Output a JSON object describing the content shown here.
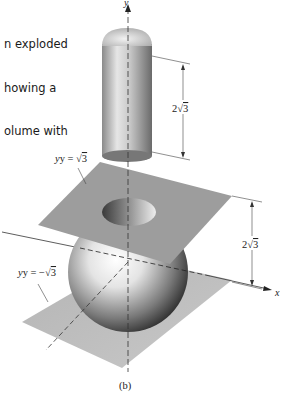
{
  "caption": {
    "lines": [
      "n exploded",
      "howing a",
      "olume with"
    ]
  },
  "figure": {
    "axes": {
      "y_label": "y",
      "x_label": "x"
    },
    "cylinder": {
      "height_label_coef": "2",
      "height_label_rad": "3"
    },
    "top_plane": {
      "label_lhs": "y = ",
      "label_rad": "3"
    },
    "bottom_plane": {
      "label_lhs": "y = −",
      "label_rad": "3"
    },
    "gap": {
      "label_coef": "2",
      "label_rad": "3"
    },
    "subfigure_label": "(b)"
  }
}
